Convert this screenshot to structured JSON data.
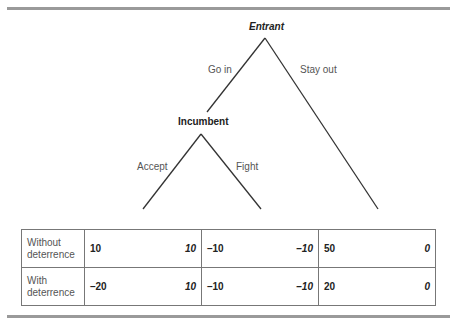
{
  "tree": {
    "root": {
      "label": "Entrant"
    },
    "root_branches": [
      {
        "label": "Go in"
      },
      {
        "label": "Stay out"
      }
    ],
    "incumbent": {
      "label": "Incumbent"
    },
    "incumbent_branches": [
      {
        "label": "Accept"
      },
      {
        "label": "Fight"
      }
    ]
  },
  "payoffs": {
    "rows": [
      {
        "label_line1": "Without",
        "label_line2": "deterrence",
        "cells": [
          {
            "entrant": "10",
            "incumbent": "10"
          },
          {
            "entrant": "–10",
            "incumbent": "–10"
          },
          {
            "entrant": "50",
            "incumbent": "0"
          }
        ]
      },
      {
        "label_line1": "With",
        "label_line2": "deterrence",
        "cells": [
          {
            "entrant": "–20",
            "incumbent": "10"
          },
          {
            "entrant": "–10",
            "incumbent": "–10"
          },
          {
            "entrant": "20",
            "incumbent": "0"
          }
        ]
      }
    ]
  }
}
